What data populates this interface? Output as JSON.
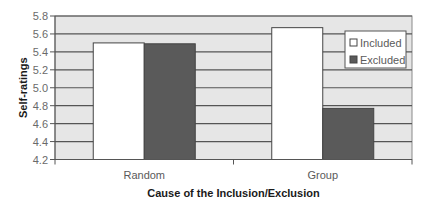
{
  "chart_data": {
    "type": "bar",
    "title": "",
    "xlabel": "Cause of the Inclusion/Exclusion",
    "ylabel": "Self-ratings",
    "categories": [
      "Random",
      "Group"
    ],
    "series": [
      {
        "name": "Included",
        "values": [
          5.5,
          5.67
        ],
        "color": "#ffffff"
      },
      {
        "name": "Excluded",
        "values": [
          5.49,
          4.77
        ],
        "color": "#5a5a5a"
      }
    ],
    "ylim": [
      4.2,
      5.8
    ],
    "yticks": [
      "4.2",
      "4.4",
      "4.6",
      "4.8",
      "5.0",
      "5.2",
      "5.4",
      "5.6",
      "5.8"
    ],
    "grid": true,
    "legend": {
      "position": "top-right",
      "entries": [
        "Included",
        "Excluded"
      ]
    },
    "colors": {
      "plot_background": "#e6e6e6",
      "gridline": "#555555",
      "bar_outline": "#444444"
    }
  }
}
